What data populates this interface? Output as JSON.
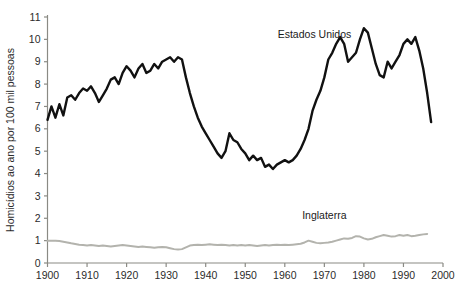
{
  "chart_data": {
    "type": "line",
    "title": "",
    "subtitle": "",
    "xlabel": "",
    "ylabel": "Homicídios ao ano por 100 mil pessoas",
    "xlim": [
      1900,
      2000
    ],
    "ylim": [
      0,
      11
    ],
    "grid": false,
    "legend_position": "inline-annotation",
    "xticks": [
      1900,
      1910,
      1920,
      1930,
      1940,
      1950,
      1960,
      1970,
      1980,
      1990,
      2000
    ],
    "xtick_labels": [
      "1900",
      "1910",
      "1920",
      "1930",
      "1940",
      "1950",
      "1960",
      "1970",
      "1980",
      "1990",
      "2000"
    ],
    "yticks": [
      0,
      1,
      2,
      3,
      4,
      5,
      6,
      7,
      8,
      9,
      10,
      11
    ],
    "ytick_labels": [
      "0",
      "1",
      "2",
      "3",
      "4",
      "5",
      "6",
      "7",
      "8",
      "9",
      "10",
      "11"
    ],
    "annotations": [
      {
        "text": "Estados Unidos",
        "x": 1967.5,
        "y": 10.05
      },
      {
        "text": "Inglaterra",
        "x": 1970.0,
        "y": 1.95
      }
    ],
    "series": [
      {
        "name": "Estados Unidos",
        "color": "#111111",
        "width": 2.4,
        "x": [
          1900,
          1901,
          1902,
          1903,
          1904,
          1905,
          1906,
          1907,
          1908,
          1909,
          1910,
          1911,
          1912,
          1913,
          1914,
          1915,
          1916,
          1917,
          1918,
          1919,
          1920,
          1921,
          1922,
          1923,
          1924,
          1925,
          1926,
          1927,
          1928,
          1929,
          1930,
          1931,
          1932,
          1933,
          1934,
          1935,
          1936,
          1937,
          1938,
          1939,
          1940,
          1941,
          1942,
          1943,
          1944,
          1945,
          1946,
          1947,
          1948,
          1949,
          1950,
          1951,
          1952,
          1953,
          1954,
          1955,
          1956,
          1957,
          1958,
          1959,
          1960,
          1961,
          1962,
          1963,
          1964,
          1965,
          1966,
          1967,
          1968,
          1969,
          1970,
          1971,
          1972,
          1973,
          1974,
          1975,
          1976,
          1977,
          1978,
          1979,
          1980,
          1981,
          1982,
          1983,
          1984,
          1985,
          1986,
          1987,
          1988,
          1989,
          1990,
          1991,
          1992,
          1993,
          1994,
          1995,
          1996,
          1997
        ],
        "values": [
          6.4,
          7.0,
          6.5,
          7.1,
          6.6,
          7.4,
          7.5,
          7.3,
          7.6,
          7.8,
          7.7,
          7.9,
          7.6,
          7.2,
          7.5,
          7.8,
          8.2,
          8.3,
          8.0,
          8.5,
          8.8,
          8.6,
          8.3,
          8.7,
          8.9,
          8.5,
          8.6,
          8.9,
          8.7,
          9.0,
          9.1,
          9.2,
          9.0,
          9.2,
          9.1,
          8.3,
          7.6,
          7.0,
          6.5,
          6.1,
          5.8,
          5.5,
          5.2,
          4.9,
          4.7,
          5.0,
          5.8,
          5.5,
          5.4,
          5.1,
          4.9,
          4.6,
          4.8,
          4.6,
          4.7,
          4.3,
          4.4,
          4.2,
          4.4,
          4.5,
          4.6,
          4.5,
          4.6,
          4.8,
          5.1,
          5.5,
          6.0,
          6.8,
          7.3,
          7.7,
          8.3,
          9.1,
          9.4,
          9.8,
          10.1,
          9.8,
          9.0,
          9.2,
          9.4,
          10.0,
          10.5,
          10.3,
          9.6,
          8.9,
          8.4,
          8.3,
          9.0,
          8.7,
          9.0,
          9.3,
          9.8,
          10.0,
          9.8,
          10.1,
          9.5,
          8.7,
          7.6,
          6.3
        ]
      },
      {
        "name": "Inglaterra",
        "color": "#b3b3ad",
        "width": 2.0,
        "x": [
          1900,
          1901,
          1902,
          1903,
          1904,
          1905,
          1906,
          1907,
          1908,
          1909,
          1910,
          1911,
          1912,
          1913,
          1914,
          1915,
          1916,
          1917,
          1918,
          1919,
          1920,
          1921,
          1922,
          1923,
          1924,
          1925,
          1926,
          1927,
          1928,
          1929,
          1930,
          1931,
          1932,
          1933,
          1934,
          1935,
          1936,
          1937,
          1938,
          1939,
          1940,
          1941,
          1942,
          1943,
          1944,
          1945,
          1946,
          1947,
          1948,
          1949,
          1950,
          1951,
          1952,
          1953,
          1954,
          1955,
          1956,
          1957,
          1958,
          1959,
          1960,
          1961,
          1962,
          1963,
          1964,
          1965,
          1966,
          1967,
          1968,
          1969,
          1970,
          1971,
          1972,
          1973,
          1974,
          1975,
          1976,
          1977,
          1978,
          1979,
          1980,
          1981,
          1982,
          1983,
          1984,
          1985,
          1986,
          1987,
          1988,
          1989,
          1990,
          1991,
          1992,
          1993,
          1994,
          1995,
          1996
        ],
        "values": [
          1.0,
          1.0,
          1.0,
          0.98,
          0.95,
          0.92,
          0.88,
          0.85,
          0.82,
          0.8,
          0.78,
          0.8,
          0.78,
          0.76,
          0.78,
          0.76,
          0.74,
          0.76,
          0.78,
          0.8,
          0.78,
          0.76,
          0.74,
          0.72,
          0.74,
          0.72,
          0.7,
          0.68,
          0.7,
          0.72,
          0.7,
          0.66,
          0.62,
          0.6,
          0.62,
          0.7,
          0.78,
          0.8,
          0.82,
          0.8,
          0.82,
          0.84,
          0.82,
          0.8,
          0.82,
          0.8,
          0.78,
          0.8,
          0.78,
          0.8,
          0.78,
          0.8,
          0.78,
          0.76,
          0.78,
          0.8,
          0.78,
          0.8,
          0.82,
          0.8,
          0.82,
          0.8,
          0.82,
          0.84,
          0.86,
          0.92,
          1.0,
          0.95,
          0.9,
          0.88,
          0.9,
          0.92,
          0.95,
          1.0,
          1.05,
          1.1,
          1.08,
          1.12,
          1.2,
          1.18,
          1.1,
          1.05,
          1.08,
          1.15,
          1.2,
          1.25,
          1.22,
          1.18,
          1.2,
          1.25,
          1.22,
          1.25,
          1.2,
          1.22,
          1.25,
          1.28,
          1.3
        ]
      }
    ]
  },
  "axis": {
    "y_title": "Homicídios ao ano por 100 mil pessoas"
  }
}
